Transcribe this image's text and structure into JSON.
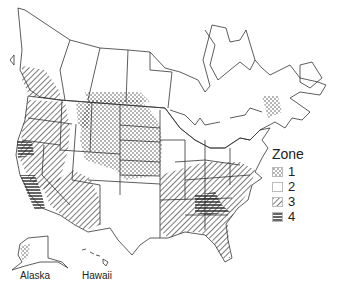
{
  "map": {
    "title": "",
    "region": "North America (Canada, United States, Alaska, Hawaii)",
    "labels": {
      "alaska": "Alaska",
      "hawaii": "Hawaii"
    }
  },
  "legend": {
    "title": "Zone",
    "items": [
      {
        "zone": "1",
        "pattern": "dots"
      },
      {
        "zone": "2",
        "pattern": "blank"
      },
      {
        "zone": "3",
        "pattern": "diagonal-hatch"
      },
      {
        "zone": "4",
        "pattern": "horizontal-lines"
      }
    ]
  },
  "zones": {
    "1": [
      "North Dakota",
      "South Dakota",
      "Nebraska",
      "Kansas",
      "Minnesota (west)",
      "Iowa (west)",
      "Montana (east)",
      "Wyoming (east)",
      "Colorado (east)",
      "Oklahoma (north)",
      "southern Saskatchewan",
      "southern Manitoba",
      "New Brunswick",
      "Alaska (coastal)"
    ],
    "2": [
      "Canada (most)",
      "Great Lakes states",
      "Northeast US",
      "Utah",
      "New Mexico",
      "Texas",
      "Montana (west)"
    ],
    "3": [
      "Washington",
      "Oregon",
      "Idaho",
      "Nevada",
      "Arizona",
      "British Columbia (south)",
      "Arkansas",
      "Louisiana",
      "Mississippi",
      "Alabama",
      "Tennessee",
      "Kentucky",
      "Virginia",
      "North Carolina",
      "South Carolina",
      "Florida",
      "Georgia (north)"
    ],
    "4": [
      "Northern California coast",
      "Central/Southern California",
      "Georgia (south)",
      "Florida panhandle",
      "Southern Alabama"
    ]
  },
  "colors": {
    "outline": "#333333",
    "hatch": "#333333",
    "background": "#ffffff"
  }
}
